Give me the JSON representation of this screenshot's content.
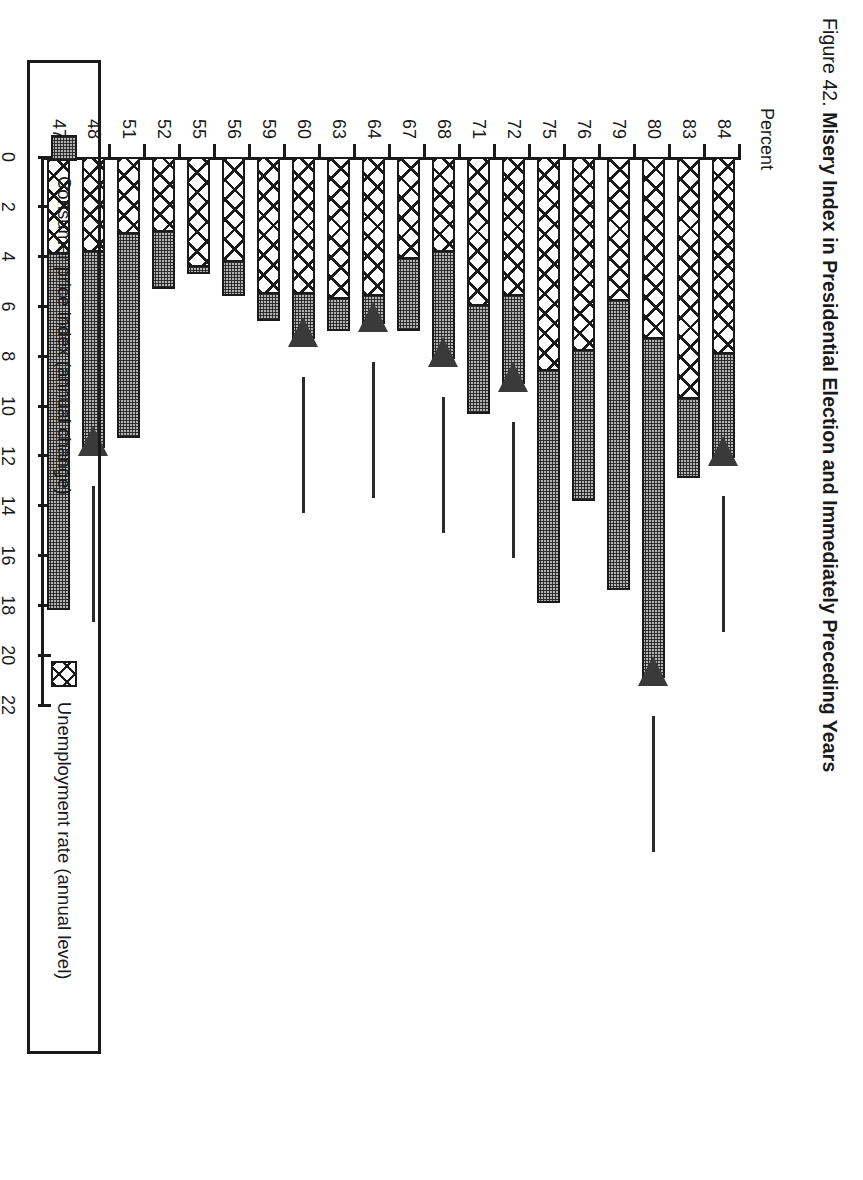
{
  "figure": {
    "number_label": "Figure 42.",
    "title": "Misery Index in Presidential Election and Immediately Preceding Years"
  },
  "axis": {
    "value_unit_label": "Percent",
    "value_ticks": [
      "0",
      "2",
      "4",
      "6",
      "8",
      "10",
      "12",
      "14",
      "16",
      "18",
      "20",
      "22"
    ]
  },
  "legend": {
    "items": [
      {
        "key": "cpi",
        "label": "Consumer price index (annual change)",
        "pattern": "stipple-gray"
      },
      {
        "key": "unemp",
        "label": "Unemployment rate (annual level)",
        "pattern": "crosshatch"
      }
    ]
  },
  "chart_data": {
    "type": "bar",
    "orientation": "horizontal",
    "stacked": true,
    "title": "Figure 42. Misery Index in Presidential Election and Immediately Preceding Years",
    "xlabel": "Percent",
    "ylabel": "",
    "xlim": [
      0,
      22
    ],
    "xticks": [
      0,
      2,
      4,
      6,
      8,
      10,
      12,
      14,
      16,
      18,
      20,
      22
    ],
    "grid": false,
    "legend_position": "bottom",
    "categories": [
      "47",
      "48",
      "51",
      "52",
      "55",
      "56",
      "59",
      "60",
      "63",
      "64",
      "67",
      "68",
      "71",
      "72",
      "75",
      "76",
      "79",
      "80",
      "83",
      "84"
    ],
    "series": [
      {
        "name": "Unemployment rate (annual level)",
        "pattern": "crosshatch",
        "values": [
          3.9,
          3.8,
          3.1,
          3.0,
          4.4,
          4.2,
          5.5,
          5.5,
          5.7,
          5.6,
          4.1,
          3.8,
          6.0,
          5.6,
          8.6,
          7.8,
          5.8,
          7.3,
          9.7,
          7.9
        ]
      },
      {
        "name": "Consumer price index (annual change)",
        "pattern": "stipple-gray",
        "values": [
          14.3,
          7.9,
          8.2,
          2.3,
          0.3,
          1.4,
          1.1,
          1.8,
          1.3,
          1.1,
          2.9,
          4.3,
          4.3,
          3.5,
          9.3,
          6.0,
          11.6,
          13.6,
          3.2,
          4.2
        ]
      }
    ],
    "totals": [
      18.2,
      11.7,
      11.3,
      5.3,
      4.7,
      5.6,
      6.6,
      7.3,
      7.0,
      6.7,
      7.0,
      8.1,
      10.3,
      9.1,
      17.9,
      13.8,
      17.4,
      20.9,
      12.9,
      12.1
    ],
    "annotations": {
      "note": "Arrows mark presidential election years",
      "marked_categories": [
        "48",
        "60",
        "64",
        "68",
        "72",
        "80",
        "84"
      ]
    }
  }
}
